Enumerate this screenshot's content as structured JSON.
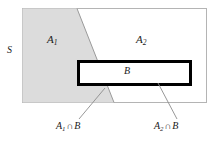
{
  "figure": {
    "type": "set-partition-venn-diagram",
    "colors": {
      "shaded_fill": "#dcdcdc",
      "outer_border": "#b0b0b0",
      "partition_line": "#9a9a9a",
      "event_b_stroke": "#000000",
      "leader_line": "#8c8c8c",
      "background": "#ffffff",
      "text": "#1a1a1a"
    },
    "labels": {
      "sample_space": "S",
      "region_a1": "A",
      "region_a1_sub": "1",
      "region_a2": "A",
      "region_a2_sub": "2",
      "event_b": "B"
    },
    "captions": {
      "left": {
        "set": "A",
        "set_sub": "1",
        "operator": "∩",
        "other": "B"
      },
      "right": {
        "set": "A",
        "set_sub": "2",
        "operator": "∩",
        "other": "B"
      }
    },
    "geometry": {
      "outer_rect": {
        "x": 22,
        "y": 8,
        "width": 185,
        "height": 95
      },
      "partition_line": {
        "x_top": 77,
        "y_top": 8,
        "x_bottom": 114,
        "y_bottom": 103
      },
      "event_b_rect": {
        "x": 77,
        "y": 60,
        "width": 115,
        "height": 26,
        "stroke_width": 3
      },
      "leader_left": {
        "x1": 105,
        "y1": 88,
        "x2": 79,
        "y2": 119
      },
      "leader_right": {
        "x1": 158,
        "y1": 82,
        "x2": 177,
        "y2": 119
      }
    }
  }
}
